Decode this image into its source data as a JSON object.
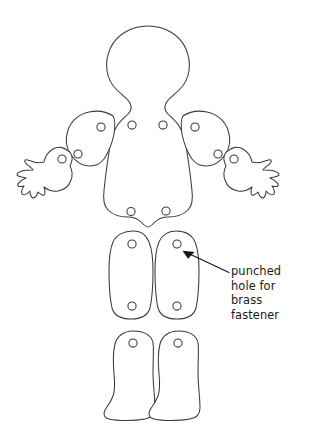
{
  "diagram": {
    "background_color": "#ffffff",
    "outline_color": "#3b3b3b",
    "annotation_color": "#1a1a1a",
    "callout": {
      "lines": [
        "punched",
        "hole for",
        "brass",
        "fastener"
      ],
      "line1": "punched",
      "line2": "hole for",
      "line3": "brass",
      "line4": "fastener",
      "arrow_from": "228,272",
      "arrow_to": "183,251",
      "points_at": "upper-right-thigh-top-hole"
    },
    "pieces": [
      {
        "name": "head-and-torso",
        "holes": 4
      },
      {
        "name": "left-upper-arm",
        "holes": 2
      },
      {
        "name": "left-forearm-hand",
        "holes": 1
      },
      {
        "name": "right-upper-arm",
        "holes": 2
      },
      {
        "name": "right-forearm-hand",
        "holes": 1
      },
      {
        "name": "left-thigh",
        "holes": 2
      },
      {
        "name": "right-thigh",
        "holes": 2
      },
      {
        "name": "left-lower-leg",
        "holes": 1
      },
      {
        "name": "right-lower-leg",
        "holes": 1
      }
    ],
    "total_pieces": 9,
    "total_holes": 16
  }
}
